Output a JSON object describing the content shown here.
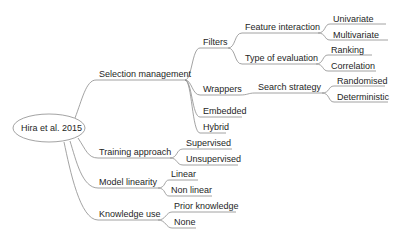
{
  "root": {
    "label": "Hira et al. 2015"
  },
  "branches": {
    "selection": {
      "label": "Selection management",
      "filters": {
        "label": "Filters",
        "feature_interaction": {
          "label": "Feature interaction",
          "children": [
            "Univariate",
            "Multivariate"
          ]
        },
        "type_of_evaluation": {
          "label": "Type of evaluation",
          "children": [
            "Ranking",
            "Correlation"
          ]
        }
      },
      "wrappers": {
        "label": "Wrappers",
        "search_strategy": {
          "label": "Search strategy",
          "children": [
            "Randomised",
            "Deterministic"
          ]
        }
      },
      "embedded": {
        "label": "Embedded"
      },
      "hybrid": {
        "label": "Hybrid"
      }
    },
    "training": {
      "label": "Training approach",
      "children": [
        "Supervised",
        "Unsupervised"
      ]
    },
    "linearity": {
      "label": "Model linearity",
      "children": [
        "Linear",
        "Non linear"
      ]
    },
    "knowledge": {
      "label": "Knowledge use",
      "children": [
        "Prior knowledge",
        "None"
      ]
    }
  },
  "colors": {
    "line": "#8c8c8c",
    "text": "#1e1e1e",
    "background": "#ffffff"
  }
}
